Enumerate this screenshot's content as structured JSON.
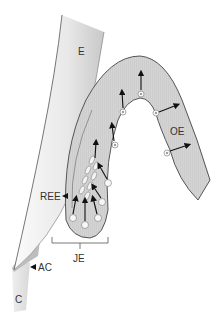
{
  "diagram": {
    "labels": {
      "enamel": "E",
      "oral_epithelium": "OE",
      "reduced_enamel_epithelium": "REE",
      "junctional_epithelium": "JE",
      "acellular_cementum": "AC",
      "cementum": "C"
    },
    "colors": {
      "epithelium_fill": "#d6d6d6",
      "epithelium_stroke": "#555555",
      "enamel_fill_light": "#f4f4f4",
      "enamel_fill_dark": "#cfcfcf",
      "cementum_fill": "#e2e2e2",
      "ac_fill": "#bdbdbd",
      "arrow": "#111111",
      "cell_fill": "#f7f7f7",
      "label": "#333333",
      "background": "#ffffff"
    },
    "caption": ""
  }
}
